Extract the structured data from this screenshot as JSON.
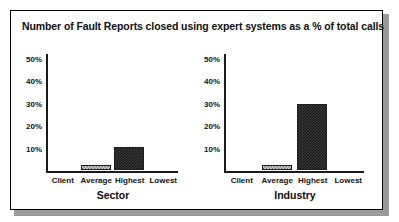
{
  "figure": {
    "title": "Number of Fault Reports closed using expert systems as a % of total calls",
    "background": "#ffffff",
    "frame_color": "#000000",
    "shadow_color": "#9a9a9a"
  },
  "chart_data": [
    {
      "type": "bar",
      "title": "Number of Fault Reports closed using expert systems as a % of total calls",
      "panel_label": "Sector",
      "xlabel": "Sector",
      "ylabel": "",
      "categories": [
        "Client",
        "Average",
        "Highest",
        "Lowest"
      ],
      "values": [
        0,
        2,
        10,
        0
      ],
      "ylim": [
        0,
        50
      ],
      "yticks": [
        10,
        20,
        30,
        40,
        50
      ],
      "ytick_labels": [
        "10%",
        "20%",
        "30%",
        "40%",
        "50%"
      ],
      "grid": false,
      "legend": "none",
      "bar_fills": [
        "none",
        "light-checker",
        "dark-checker",
        "none"
      ]
    },
    {
      "type": "bar",
      "title": "Number of Fault Reports closed using expert systems as a % of total calls",
      "panel_label": "Industry",
      "xlabel": "Industry",
      "ylabel": "",
      "categories": [
        "Client",
        "Average",
        "Highest",
        "Lowest"
      ],
      "values": [
        0,
        2,
        29,
        0
      ],
      "ylim": [
        0,
        50
      ],
      "yticks": [
        10,
        20,
        30,
        40,
        50
      ],
      "ytick_labels": [
        "10%",
        "20%",
        "30%",
        "40%",
        "50%"
      ],
      "grid": false,
      "legend": "none",
      "bar_fills": [
        "none",
        "light-checker",
        "dark-checker",
        "none"
      ]
    }
  ]
}
